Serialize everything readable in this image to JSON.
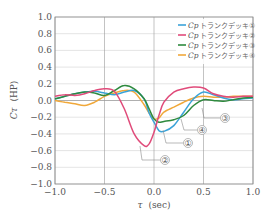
{
  "chart_data": {
    "type": "line",
    "title": "",
    "xlabel": "τ (sec)",
    "ylabel": "Cτ (HP)",
    "xlim": [
      -1.0,
      1.0
    ],
    "ylim": [
      -1.0,
      1.0
    ],
    "grid": true,
    "legend_position": "upper right",
    "x_ticks": [
      "−1.0",
      "−0.5",
      "0.0",
      "0.5",
      "1.0"
    ],
    "y_ticks": [
      "1.0",
      "0.8",
      "0.6",
      "0.4",
      "0.2",
      "0.0",
      "−0.2",
      "−0.4",
      "−0.6",
      "−0.8",
      "−1.0"
    ],
    "x": [
      -1.0,
      -0.9,
      -0.8,
      -0.7,
      -0.6,
      -0.5,
      -0.4,
      -0.3,
      -0.2,
      -0.1,
      -0.05,
      0.0,
      0.05,
      0.1,
      0.2,
      0.3,
      0.4,
      0.5,
      0.6,
      0.7,
      0.8,
      0.9,
      1.0
    ],
    "series": [
      {
        "name": "Cp トランクデッキ①",
        "marker": "①",
        "color": "#3ba3d8",
        "values": [
          0.02,
          0.05,
          0.08,
          0.1,
          0.11,
          0.09,
          0.07,
          0.1,
          0.12,
          0.02,
          -0.15,
          -0.26,
          -0.36,
          -0.37,
          -0.3,
          -0.14,
          0.02,
          0.1,
          0.07,
          0.03,
          0.01,
          0.02,
          0.03
        ]
      },
      {
        "name": "Cp トランクデッキ②",
        "marker": "②",
        "color": "#e04b7a",
        "values": [
          0.05,
          0.07,
          0.06,
          0.08,
          0.12,
          0.14,
          0.11,
          -0.1,
          -0.4,
          -0.54,
          -0.52,
          -0.38,
          -0.18,
          -0.02,
          0.1,
          0.14,
          0.16,
          0.15,
          0.08,
          0.05,
          0.04,
          0.05,
          0.05
        ]
      },
      {
        "name": "Cp トランクデッキ③",
        "marker": "③",
        "color": "#2e8a3e",
        "values": [
          0.02,
          0.05,
          0.08,
          0.1,
          0.09,
          0.06,
          0.12,
          0.18,
          0.14,
          0.02,
          -0.1,
          -0.22,
          -0.26,
          -0.25,
          -0.23,
          -0.18,
          -0.06,
          0.01,
          0.0,
          -0.01,
          0.01,
          0.03,
          0.04
        ]
      },
      {
        "name": "Cp トランクデッキ④",
        "marker": "④",
        "color": "#f0a83a",
        "values": [
          0.0,
          -0.02,
          -0.04,
          -0.06,
          -0.02,
          0.05,
          0.09,
          0.12,
          0.1,
          -0.05,
          -0.15,
          -0.22,
          -0.21,
          -0.14,
          -0.08,
          -0.02,
          0.03,
          0.05,
          0.04,
          0.04,
          0.05,
          0.05,
          0.05
        ]
      }
    ],
    "annotations": [
      {
        "label": "①",
        "target_series": "Cp トランクデッキ①"
      },
      {
        "label": "②",
        "target_series": "Cp トランクデッキ②"
      },
      {
        "label": "③",
        "target_series": "Cp トランクデッキ③"
      },
      {
        "label": "④",
        "target_series": "Cp トランクデッキ④"
      }
    ]
  },
  "axes": {
    "xlabel_symbol": "τ",
    "xlabel_unit": "(sec)",
    "ylabel_symbol": "Cτ",
    "ylabel_unit": "(HP)"
  },
  "legend": {
    "items": [
      {
        "symbol": "Cp",
        "text": "トランクデッキ①",
        "color": "#3ba3d8"
      },
      {
        "symbol": "Cp",
        "text": "トランクデッキ②",
        "color": "#e04b7a"
      },
      {
        "symbol": "Cp",
        "text": "トランクデッキ③",
        "color": "#2e8a3e"
      },
      {
        "symbol": "Cp",
        "text": "トランクデッキ④",
        "color": "#f0a83a"
      }
    ]
  },
  "callouts": [
    "①",
    "②",
    "③",
    "④"
  ]
}
